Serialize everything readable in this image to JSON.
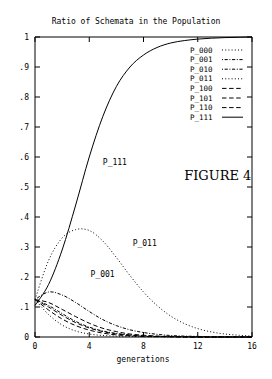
{
  "chart_data": {
    "type": "line",
    "title": "Ratio of Schemata in the Population",
    "xlabel": "generations",
    "ylabel": "",
    "xlim": [
      0,
      16
    ],
    "ylim": [
      0,
      1
    ],
    "grid": false,
    "legend_position": "top-right-inside",
    "xticks": [
      "0",
      "4",
      "8",
      "12",
      "16"
    ],
    "xtick_values": [
      0,
      4,
      8,
      12,
      16
    ],
    "yticks": [
      "0",
      ".1",
      ".2",
      ".3",
      ".4",
      ".5",
      ".6",
      ".7",
      ".8",
      ".9",
      "1"
    ],
    "ytick_values": [
      0,
      0.1,
      0.2,
      0.3,
      0.4,
      0.5,
      0.6,
      0.7,
      0.8,
      0.9,
      1
    ],
    "x": [
      0,
      1,
      2,
      3,
      4,
      5,
      6,
      7,
      8,
      9,
      10,
      11,
      12,
      13,
      14,
      15,
      16
    ],
    "series": [
      {
        "name": "P_000",
        "dash": "dotted",
        "values": [
          0.125,
          0.075,
          0.04,
          0.02,
          0.01,
          0.005,
          0.003,
          0.002,
          0.001,
          0.001,
          0.0,
          0.0,
          0.0,
          0.0,
          0.0,
          0.0,
          0.0
        ]
      },
      {
        "name": "P_001",
        "dash": "dash-dot",
        "values": [
          0.125,
          0.15,
          0.14,
          0.115,
          0.085,
          0.058,
          0.038,
          0.024,
          0.015,
          0.009,
          0.005,
          0.003,
          0.002,
          0.001,
          0.001,
          0.0,
          0.0
        ]
      },
      {
        "name": "P_010",
        "dash": "dash-dot",
        "values": [
          0.125,
          0.105,
          0.078,
          0.052,
          0.033,
          0.02,
          0.012,
          0.007,
          0.004,
          0.002,
          0.001,
          0.001,
          0.0,
          0.0,
          0.0,
          0.0,
          0.0
        ]
      },
      {
        "name": "P_011",
        "dash": "dotted",
        "values": [
          0.125,
          0.255,
          0.33,
          0.358,
          0.355,
          0.32,
          0.265,
          0.205,
          0.15,
          0.105,
          0.07,
          0.045,
          0.028,
          0.017,
          0.01,
          0.006,
          0.003
        ]
      },
      {
        "name": "P_100",
        "dash": "dashed",
        "values": [
          0.125,
          0.09,
          0.06,
          0.038,
          0.023,
          0.013,
          0.007,
          0.004,
          0.002,
          0.001,
          0.001,
          0.0,
          0.0,
          0.0,
          0.0,
          0.0,
          0.0
        ]
      },
      {
        "name": "P_101",
        "dash": "dashed",
        "values": [
          0.125,
          0.115,
          0.092,
          0.068,
          0.046,
          0.029,
          0.018,
          0.01,
          0.006,
          0.003,
          0.002,
          0.001,
          0.0,
          0.0,
          0.0,
          0.0,
          0.0
        ]
      },
      {
        "name": "P_110",
        "dash": "dashed",
        "values": [
          0.125,
          0.1,
          0.072,
          0.048,
          0.03,
          0.018,
          0.01,
          0.006,
          0.003,
          0.002,
          0.001,
          0.0,
          0.0,
          0.0,
          0.0,
          0.0,
          0.0
        ]
      },
      {
        "name": "P_111",
        "dash": "solid",
        "values": [
          0.105,
          0.175,
          0.29,
          0.44,
          0.6,
          0.735,
          0.835,
          0.9,
          0.94,
          0.965,
          0.98,
          0.988,
          0.993,
          0.996,
          0.998,
          0.999,
          1.0
        ]
      }
    ],
    "annotations": [
      {
        "text": "P_111",
        "x": 5.0,
        "y": 0.575
      },
      {
        "text": "P_011",
        "x": 7.2,
        "y": 0.305
      },
      {
        "text": "P_001",
        "x": 4.1,
        "y": 0.2
      },
      {
        "text": "FIGURE 4",
        "x": 11.0,
        "y": 0.525
      }
    ]
  },
  "legend": {
    "entries": [
      {
        "label": "P_000"
      },
      {
        "label": "P_001"
      },
      {
        "label": "P_010"
      },
      {
        "label": "P_011"
      },
      {
        "label": "P_100"
      },
      {
        "label": "P_101"
      },
      {
        "label": "P_110"
      },
      {
        "label": "P_111"
      }
    ]
  }
}
